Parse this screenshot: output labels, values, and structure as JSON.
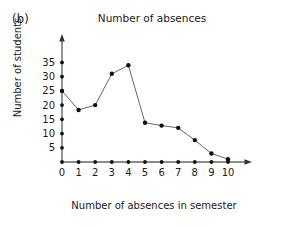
{
  "figure": {
    "panel_label": "(b)",
    "title": "Number of absences"
  },
  "axes": {
    "x_title": "Number of absences in semester",
    "y_title": "Number of students"
  },
  "chart_data": {
    "type": "line",
    "title": "Number of absences",
    "xlabel": "Number of absences in semester",
    "ylabel": "Number of students",
    "x": [
      0,
      1,
      2,
      3,
      4,
      5,
      6,
      7,
      8,
      9,
      10
    ],
    "values": [
      25,
      18.3,
      20,
      31,
      34,
      13.8,
      12.8,
      12,
      7.7,
      3,
      1
    ],
    "xlim": [
      0,
      10
    ],
    "ylim": [
      0,
      36
    ],
    "xticks": [
      "0",
      "1",
      "2",
      "3",
      "4",
      "5",
      "6",
      "7",
      "8",
      "9",
      "10"
    ],
    "yticks": [
      "5",
      "10",
      "15",
      "20",
      "25",
      "30",
      "35"
    ],
    "ytick_values": [
      5,
      10,
      15,
      20,
      25,
      30,
      35
    ],
    "grid": false,
    "legend": null,
    "marker": "filled-circle",
    "line_color": "#555555",
    "marker_color": "#111111",
    "axis_color": "#555555"
  }
}
